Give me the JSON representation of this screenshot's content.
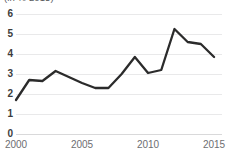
{
  "chart_data": {
    "type": "line",
    "title": "",
    "subtitle": "(in % 2015)",
    "xlabel": "",
    "ylabel": "",
    "x": [
      2000,
      2001,
      2002,
      2003,
      2004,
      2005,
      2006,
      2007,
      2008,
      2009,
      2010,
      2011,
      2012,
      2013,
      2014,
      2015
    ],
    "values": [
      1.7,
      2.7,
      2.65,
      3.15,
      2.85,
      2.55,
      2.3,
      2.3,
      3.0,
      3.85,
      3.05,
      3.2,
      5.25,
      4.6,
      4.5,
      3.85
    ],
    "series": [
      {
        "name": "series-1",
        "values": [
          1.7,
          2.7,
          2.65,
          3.15,
          2.85,
          2.55,
          2.3,
          2.3,
          3.0,
          3.85,
          3.05,
          3.2,
          5.25,
          4.6,
          4.5,
          3.85
        ],
        "color": "#2b2b2b"
      }
    ],
    "xlim": [
      2000,
      2015.6
    ],
    "ylim": [
      0,
      6
    ],
    "y_ticks": [
      0,
      1,
      2,
      3,
      4,
      5,
      6
    ],
    "y_tick_labels": [
      "0",
      "1",
      "2",
      "3",
      "4",
      "5",
      "6"
    ],
    "x_ticks": [
      2000,
      2005,
      2010,
      2015
    ],
    "x_tick_labels": [
      "2000",
      "2005",
      "2010",
      "2015"
    ],
    "grid": "horizontal",
    "legend": "none",
    "annotations": []
  },
  "axis": {
    "y_labels": [
      "6",
      "5",
      "4",
      "3",
      "2",
      "1",
      "0"
    ],
    "x_labels": [
      "2000",
      "2005",
      "2010",
      "2015"
    ]
  },
  "colors": {
    "line": "#2b2b2b",
    "grid": "#e9e9ea",
    "tick_text": "#6d6e71",
    "ytick_text": "#3c3c3c",
    "background": "#ffffff"
  }
}
